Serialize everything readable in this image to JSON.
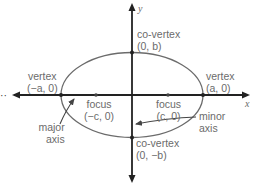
{
  "diagram": {
    "type": "ellipse-anatomy",
    "axes": {
      "x_label": "x",
      "y_label": "y"
    },
    "ellipse": {
      "center": [
        132,
        95
      ],
      "rx": 71,
      "ry": 42.5,
      "stroke": "#6b6b6b"
    },
    "colors": {
      "axis": "#222222",
      "curve": "#6b6b6b",
      "text": "#6b6b6b"
    },
    "labels": {
      "co_vertex_top": {
        "title": "co-vertex",
        "coord": "(0, b)"
      },
      "co_vertex_bottom": {
        "title": "co-vertex",
        "coord": "(0, −b)"
      },
      "vertex_left": {
        "title": "vertex",
        "coord": "(−a, 0)"
      },
      "vertex_right": {
        "title": "vertex",
        "coord": "(a, 0)"
      },
      "focus_left": {
        "title": "focus",
        "coord": "(−c, 0)"
      },
      "focus_right": {
        "title": "focus",
        "coord": "(c, 0)"
      },
      "major_axis": {
        "line1": "major",
        "line2": "axis"
      },
      "minor_axis": {
        "line1": "minor",
        "line2": "axis"
      }
    },
    "ellipsis_marker": "··"
  }
}
